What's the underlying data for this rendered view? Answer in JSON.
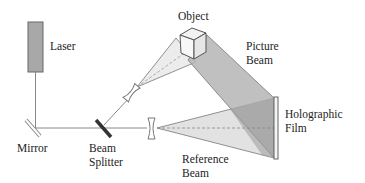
{
  "diagram": {
    "labels": {
      "laser": "Laser",
      "object": "Object",
      "picture_beam_1": "Picture",
      "picture_beam_2": "Beam",
      "holographic_film_1": "Holographic",
      "holographic_film_2": "Film",
      "mirror": "Mirror",
      "beam_splitter_1": "Beam",
      "beam_splitter_2": "Splitter",
      "reference_beam_1": "Reference",
      "reference_beam_2": "Beam"
    },
    "components": [
      "laser",
      "mirror",
      "beam-splitter",
      "diverging-lens-object",
      "diverging-lens-reference",
      "object-cube",
      "holographic-film"
    ],
    "colors": {
      "line": "#777777",
      "laser_fill": "#a8a8a8",
      "picture_beam": "#b5b5b5",
      "reference_beam": "#e2e2e2",
      "overlap": "#9a9a9a",
      "splitter": "#333333",
      "text": "#222222"
    }
  }
}
